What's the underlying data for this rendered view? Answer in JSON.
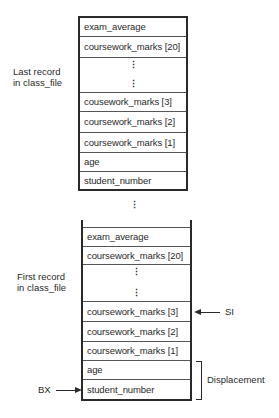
{
  "diagram": {
    "last_record": {
      "label_line1": "Last record",
      "label_line2": "in class_file",
      "fields": [
        {
          "name": "exam_average"
        },
        {
          "name": "coursework_marks [20]"
        },
        {
          "name": "ellipsis",
          "dots": [
            "⋮",
            "⋮"
          ]
        },
        {
          "name": "cousework_marks [3]"
        },
        {
          "name": "coursework_marks [2]"
        },
        {
          "name": "coursework_marks [1]"
        },
        {
          "name": "age"
        },
        {
          "name": "student_number"
        }
      ]
    },
    "between_records_ellipsis": "⋮",
    "first_record": {
      "label_line1": "First record",
      "label_line2": "in class_file",
      "fields": [
        {
          "name": "exam_average"
        },
        {
          "name": "coursework_marks [20]"
        },
        {
          "name": "ellipsis",
          "dots": [
            "⋮",
            "⋮"
          ]
        },
        {
          "name": "coursework_marks [3]"
        },
        {
          "name": "coursework_marks [2]"
        },
        {
          "name": "coursework_marks [1]"
        },
        {
          "name": "age"
        },
        {
          "name": "student_number"
        }
      ]
    },
    "pointers": {
      "si_label": "SI",
      "bx_label": "BX",
      "displacement_label": "Displacement"
    }
  }
}
